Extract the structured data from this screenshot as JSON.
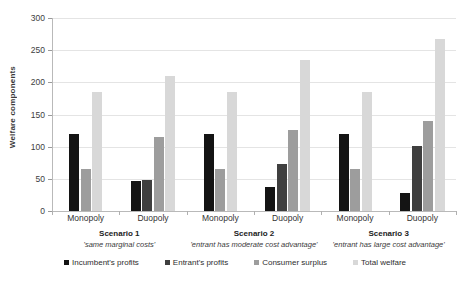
{
  "chart_data": {
    "type": "bar",
    "title": "",
    "xlabel": "",
    "ylabel": "Welfare components",
    "ylim": [
      0,
      300
    ],
    "yticks": [
      0,
      50,
      100,
      150,
      200,
      250,
      300
    ],
    "ytick_labels": [
      "0",
      "50",
      "100",
      "150",
      "200",
      "250",
      "300"
    ],
    "grid": true,
    "legend_position": "bottom",
    "categories": [
      "Scenario 1 - Monopoly",
      "Scenario 1 - Duopoly",
      "Scenario 2 - Monopoly",
      "Scenario 2 - Duopoly",
      "Scenario 3 - Monopoly",
      "Scenario 3 - Duopoly"
    ],
    "series": [
      {
        "name": "Incumbent's profits",
        "color": "#141414",
        "values": [
          119,
          47,
          119,
          38,
          119,
          28
        ]
      },
      {
        "name": "Entrant's profits",
        "color": "#3f3f3f",
        "values": [
          0,
          48,
          0,
          73,
          0,
          101
        ]
      },
      {
        "name": "Consumer surplus",
        "color": "#9d9d9d",
        "values": [
          65,
          115,
          65,
          126,
          65,
          140
        ]
      },
      {
        "name": "Total welfare",
        "color": "#d8d8d8",
        "values": [
          185,
          210,
          185,
          234,
          185,
          267
        ]
      }
    ],
    "groups": [
      {
        "scenario": "Scenario 1",
        "description": "'same marginal costs'",
        "market_labels": [
          "Monopoly",
          "Duopoly"
        ]
      },
      {
        "scenario": "Scenario 2",
        "description": "'entrant has moderate cost advantage'",
        "market_labels": [
          "Monopoly",
          "Duopoly"
        ]
      },
      {
        "scenario": "Scenario 3",
        "description": "'entrant has large cost advantage'",
        "market_labels": [
          "Monopoly",
          "Duopoly"
        ]
      }
    ],
    "legend": [
      {
        "label": "Incumbent's profits",
        "color": "#141414"
      },
      {
        "label": "Entrant's profits",
        "color": "#3f3f3f"
      },
      {
        "label": "Consumer surplus",
        "color": "#9d9d9d"
      },
      {
        "label": "Total welfare",
        "color": "#d8d8d8"
      }
    ]
  }
}
